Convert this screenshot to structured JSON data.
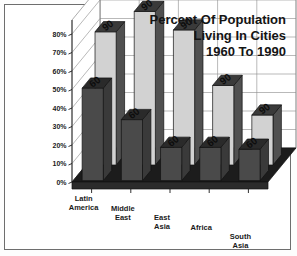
{
  "chart_data": {
    "type": "bar",
    "title_lines": [
      "Percent Of Population",
      "Living In Cities",
      "1960 To 1990"
    ],
    "xlabel": "",
    "ylabel": "",
    "ylim": [
      0,
      80
    ],
    "grid": true,
    "legend_position": "none",
    "style": "3d-grouped-bar-grayscale",
    "categories": [
      "Latin America",
      "Middle East",
      "East Asia",
      "Africa",
      "South Asia"
    ],
    "category_lines": [
      [
        "Latin",
        "America"
      ],
      [
        "Middle",
        "East"
      ],
      [
        "East",
        "Asia"
      ],
      [
        "Africa",
        ""
      ],
      [
        "South",
        "Asia"
      ]
    ],
    "ticks": [
      "0%",
      "10%",
      "20%",
      "30%",
      "40%",
      "50%",
      "60%",
      "70%",
      "80%"
    ],
    "tick_values": [
      0,
      10,
      20,
      30,
      40,
      50,
      60,
      70,
      80
    ],
    "series": [
      {
        "name": "1990",
        "label": "90",
        "color": "#d2d2d2",
        "values": [
          72,
          83,
          73,
          43,
          27
        ]
      },
      {
        "name": "1960",
        "label": "60",
        "color": "#4a4a4a",
        "values": [
          50,
          33,
          18,
          18,
          17
        ]
      }
    ],
    "bar_top_labels": [
      [
        "90",
        "60"
      ],
      [
        "90",
        "60"
      ],
      [
        "90",
        "60"
      ],
      [
        "90",
        "60"
      ],
      [
        "90",
        "60"
      ]
    ],
    "colors": {
      "floor": "#1c1c1c",
      "wall": "#ffffff",
      "gridline": "#8a8a8a",
      "bar_1990_front": "#d2d2d2",
      "bar_1990_top": "#3a3a3a",
      "bar_1990_side": "#505050",
      "bar_1960_front": "#4a4a4a",
      "bar_1960_top": "#2a2a2a",
      "bar_1960_side": "#3a3a3a",
      "text": "#141414",
      "frame_border": "#6e6e6e"
    }
  }
}
